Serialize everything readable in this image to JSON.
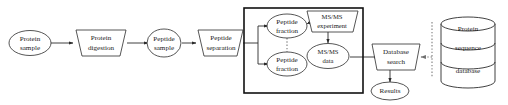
{
  "diagram": {
    "type": "flowchart",
    "colors": {
      "background": "#ffffff",
      "stroke": "#2b2b2b",
      "group_box_stroke": "#111111",
      "dotted_stroke": "#7d7d7d",
      "text": "#1a1a1a"
    },
    "nodes": {
      "protein_sample": {
        "shape": "ellipse",
        "line1": "Protein",
        "line2": "sample"
      },
      "protein_digestion": {
        "shape": "parallelogram",
        "line1": "Protein",
        "line2": "digestion"
      },
      "peptide_sample": {
        "shape": "ellipse",
        "line1": "Peptide",
        "line2": "sample"
      },
      "peptide_separation": {
        "shape": "parallelogram",
        "line1": "Peptide",
        "line2": "separation"
      },
      "peptide_fraction_top": {
        "shape": "ellipse",
        "line1": "Peptide",
        "line2": "fraction"
      },
      "peptide_fraction_bottom": {
        "shape": "ellipse",
        "line1": "Peptide",
        "line2": "fraction"
      },
      "msms_experiment": {
        "shape": "parallelogram",
        "line1": "MS/MS",
        "line2": "experiment"
      },
      "msms_data": {
        "shape": "ellipse",
        "line1": "MS/MS",
        "line2": "data"
      },
      "database_search": {
        "shape": "parallelogram",
        "line1": "Database",
        "line2": "search"
      },
      "results": {
        "shape": "ellipse",
        "line1": "Results"
      },
      "protein_sequence_database": {
        "shape": "cylinder",
        "line1": "Protein",
        "line2": "sequence",
        "line3": "database"
      }
    },
    "group_box": {
      "label": "",
      "contains": [
        "peptide_fraction_top",
        "peptide_fraction_bottom",
        "msms_experiment",
        "msms_data"
      ]
    },
    "edges": [
      {
        "from": "protein_sample",
        "to": "protein_digestion",
        "style": "solid-arrow"
      },
      {
        "from": "protein_digestion",
        "to": "peptide_sample",
        "style": "solid-arrow"
      },
      {
        "from": "peptide_sample",
        "to": "peptide_separation",
        "style": "solid-arrow"
      },
      {
        "from": "peptide_separation",
        "to": "peptide_fraction_top",
        "style": "solid-arrow-branch"
      },
      {
        "from": "peptide_separation",
        "to": "peptide_fraction_bottom",
        "style": "solid-arrow-branch"
      },
      {
        "from": "peptide_fraction_top",
        "to": "peptide_fraction_bottom",
        "style": "dotted"
      },
      {
        "from": "peptide_fraction_top",
        "to": "msms_experiment",
        "style": "solid-arrow"
      },
      {
        "from": "msms_experiment",
        "to": "msms_data",
        "style": "solid-arrow"
      },
      {
        "from": "msms_data",
        "to": "database_search",
        "style": "solid-arrow"
      },
      {
        "from": "protein_sequence_database",
        "to": "database_search",
        "style": "dotted-arrow"
      },
      {
        "from": "database_search",
        "to": "results",
        "style": "solid-arrow"
      }
    ]
  }
}
